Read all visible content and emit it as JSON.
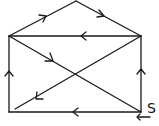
{
  "diagram": {
    "type": "directed-graph-envelope",
    "stroke_color": "#1a1a1a",
    "start_label": "S",
    "vertices": [
      {
        "id": "apex",
        "x": 76,
        "y": 1
      },
      {
        "id": "top-left",
        "x": 9,
        "y": 36
      },
      {
        "id": "top-right",
        "x": 141,
        "y": 36
      },
      {
        "id": "bottom-left",
        "x": 9,
        "y": 112
      },
      {
        "id": "bottom-right",
        "x": 141,
        "y": 112
      }
    ],
    "edges": [
      {
        "from": "bottom-right",
        "to": "top-right",
        "direction": "up"
      },
      {
        "from": "top-right",
        "to": "top-left",
        "direction": "left"
      },
      {
        "from": "top-left",
        "to": "bottom-right",
        "direction": "down-right"
      },
      {
        "from": "bottom-right",
        "to": "bottom-left",
        "direction": "left"
      },
      {
        "from": "bottom-left",
        "to": "top-left",
        "direction": "up"
      },
      {
        "from": "top-left",
        "to": "apex",
        "direction": "up-right"
      },
      {
        "from": "apex",
        "to": "top-right",
        "direction": "down-right"
      },
      {
        "from": "top-right",
        "to": "bottom-left",
        "direction": "down-left"
      }
    ]
  }
}
